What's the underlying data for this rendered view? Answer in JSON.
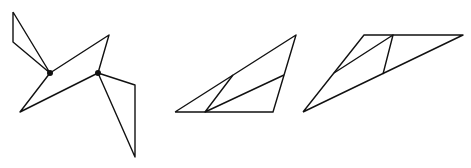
{
  "canvas": {
    "width": 471,
    "height": 168,
    "background": "#ffffff",
    "stroke": "#111111"
  },
  "figures": [
    {
      "name": "figure-1",
      "polylines": [
        [
          [
            13,
            12
          ],
          [
            13,
            42
          ],
          [
            50,
            73
          ],
          [
            13,
            12
          ]
        ],
        [
          [
            50,
            73
          ],
          [
            109,
            35
          ],
          [
            98,
            73
          ],
          [
            20,
            112
          ],
          [
            50,
            73
          ]
        ],
        [
          [
            98,
            73
          ],
          [
            135,
            85
          ],
          [
            135,
            157
          ],
          [
            98,
            73
          ]
        ]
      ],
      "dots": [
        [
          50,
          73
        ],
        [
          98,
          73
        ]
      ]
    },
    {
      "name": "figure-2",
      "polylines": [
        [
          [
            175,
            112
          ],
          [
            296,
            35
          ],
          [
            273,
            112
          ],
          [
            175,
            112
          ]
        ],
        [
          [
            233,
            75
          ],
          [
            205,
            112
          ],
          [
            284,
            75
          ]
        ]
      ],
      "dots": []
    },
    {
      "name": "figure-3",
      "polylines": [
        [
          [
            303,
            112
          ],
          [
            364,
            35
          ],
          [
            463,
            35
          ],
          [
            303,
            112
          ]
        ],
        [
          [
            334,
            73
          ],
          [
            393,
            35
          ],
          [
            383,
            74
          ]
        ]
      ],
      "dots": []
    }
  ]
}
